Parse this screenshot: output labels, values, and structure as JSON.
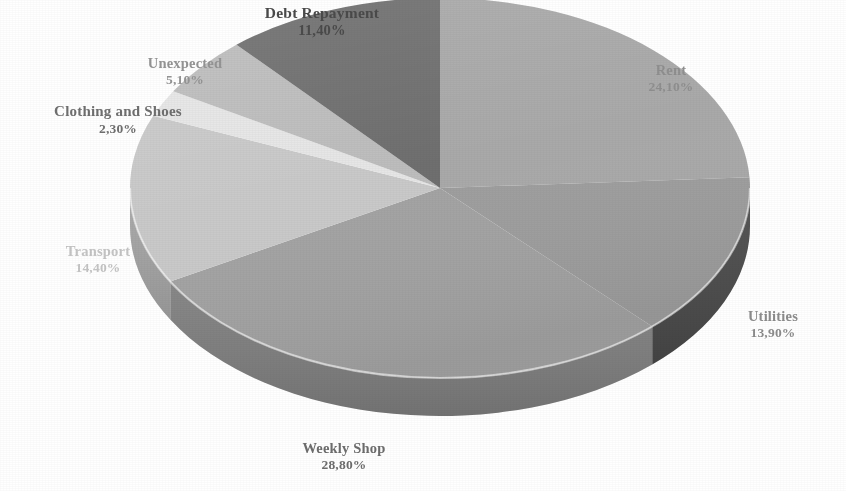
{
  "chart_data": {
    "type": "pie",
    "title": "",
    "subtitle": "",
    "xlabel": "",
    "ylabel": "",
    "legend_position": "none",
    "grid": false,
    "three_d": true,
    "decimal_separator": ",",
    "start_angle_deg": 0,
    "direction": "clockwise",
    "categories": [
      "Rent",
      "Utilities",
      "Weekly Shop",
      "Transport",
      "Clothing and Shoes",
      "Unexpected",
      "Debt Repayment"
    ],
    "values": [
      24.1,
      13.9,
      28.8,
      14.4,
      2.3,
      5.1,
      11.4
    ],
    "value_labels": [
      "24,10%",
      "13,90%",
      "28,80%",
      "14,40%",
      "2,30%",
      "5,10%",
      "11,40%"
    ],
    "slice_colors": [
      "#a9a9a9",
      "#9e9e9e",
      "#a3a3a3",
      "#c9c9c9",
      "#e6e6e6",
      "#bdbdbd",
      "#6f6f6f"
    ],
    "side_colors": [
      "#8c8c8c",
      "#4a4a4a",
      "#7f7f7f",
      "#a6a6a6",
      "#c2c2c2",
      "#9c9c9c",
      "#5a5a5a"
    ],
    "total": 100.0
  },
  "chart": {
    "background_color": "#ffffff",
    "slices": [
      {
        "name": "Rent",
        "value_label": "24,10%",
        "value": 24.1
      },
      {
        "name": "Utilities",
        "value_label": "13,90%",
        "value": 13.9
      },
      {
        "name": "Weekly Shop",
        "value_label": "28,80%",
        "value": 28.8
      },
      {
        "name": "Transport",
        "value_label": "14,40%",
        "value": 14.4
      },
      {
        "name": "Clothing and Shoes",
        "value_label": "2,30%",
        "value": 2.3
      },
      {
        "name": "Unexpected",
        "value_label": "5,10%",
        "value": 5.1
      },
      {
        "name": "Debt Repayment",
        "value_label": "11,40%",
        "value": 11.4
      }
    ]
  }
}
